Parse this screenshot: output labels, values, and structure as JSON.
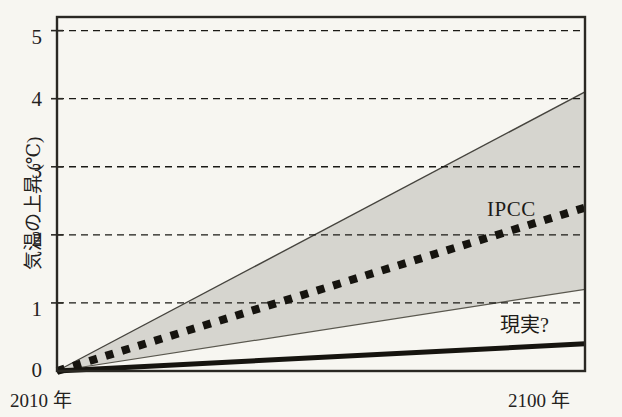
{
  "chart_data": {
    "type": "line",
    "title": "",
    "xlabel": "",
    "ylabel": "気温の上昇 (℃)",
    "x": [
      2010,
      2100
    ],
    "xlim": [
      2010,
      2100
    ],
    "ylim": [
      0,
      5.2
    ],
    "grid": true,
    "legend_position": "inline-annotation",
    "xtick_labels": [
      "2010 年",
      "2100 年"
    ],
    "ytick_labels": [
      "0",
      "1",
      "2",
      "3",
      "4",
      "5"
    ],
    "ytick_values": [
      0,
      1,
      2,
      3,
      4,
      5
    ],
    "series": [
      {
        "name": "IPCC",
        "style": "thick-dotted",
        "color": "#16140f",
        "values": [
          0,
          2.4
        ]
      },
      {
        "name": "現実?",
        "style": "thick-solid",
        "color": "#16140f",
        "values": [
          0,
          0.4
        ]
      },
      {
        "name": "IPCC range upper",
        "style": "thin-solid-band-edge",
        "color": "#3b3a35",
        "values": [
          0,
          4.1
        ]
      },
      {
        "name": "IPCC range lower",
        "style": "thin-solid-band-edge",
        "color": "#3b3a35",
        "values": [
          0,
          1.2
        ]
      }
    ],
    "band": {
      "name": "IPCC uncertainty range",
      "fill": "#d6d5cf",
      "upper": [
        0,
        4.1
      ],
      "lower": [
        0,
        1.2
      ]
    },
    "annotations": [
      {
        "text": "IPCC",
        "x": 2095,
        "y": 2.75
      },
      {
        "text": "現実?",
        "x": 2096,
        "y": 1.0
      }
    ]
  },
  "axis": {
    "y_label": "気温の上昇 (℃)",
    "x_left_label": "2010 年",
    "x_right_label": "2100 年",
    "ticks": [
      {
        "label": "5",
        "value": 5
      },
      {
        "label": "4",
        "value": 4
      },
      {
        "label": "3",
        "value": 3
      },
      {
        "label": "2",
        "value": 2
      },
      {
        "label": "1",
        "value": 1
      },
      {
        "label": "0",
        "value": 0
      }
    ]
  },
  "labels": {
    "ipcc": "IPCC",
    "reality": "現実?"
  },
  "colors": {
    "background": "#f7f6f1",
    "band_fill": "#d6d5cf",
    "line": "#16140f",
    "frame": "#2a2823",
    "grid": "#1b1a16"
  }
}
